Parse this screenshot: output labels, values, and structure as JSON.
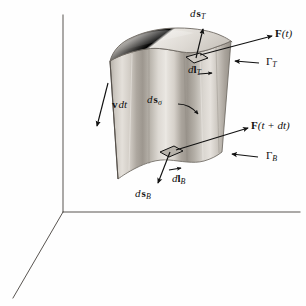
{
  "figure": {
    "name": "swept-surface-diagram",
    "background_color": "#fefefe",
    "ink_color": "#111111",
    "axis_color": "#555555",
    "surface_colors": {
      "top_cap_light": "#dedad4",
      "top_cap_mid": "#cfcac3",
      "body_light": "#e7e3dd",
      "body_mid": "#c9c4bc",
      "body_dark": "#a8a39b",
      "body_darkest": "#8f8a82",
      "outline": "#6d6862"
    }
  },
  "axes": {
    "origin_label": "",
    "vertical_axis_name": "vertical-axis",
    "horizontal_axis_name": "horizontal-axis",
    "depth_axis_name": "depth-axis"
  },
  "labels": {
    "ds_top": {
      "d": "d",
      "vec": "s",
      "sub": "T"
    },
    "F_t": {
      "vec": "F",
      "arg": "(t)"
    },
    "gamma_top": {
      "sym": "Γ",
      "sub": "T"
    },
    "dl_top": {
      "d": "d",
      "vec": "l",
      "sub": "T"
    },
    "v_dt": {
      "vec": "v",
      "rest": "dt"
    },
    "ds_sigma": {
      "d": "d",
      "vec": "s",
      "sub": "σ"
    },
    "F_t_dt": {
      "vec": "F",
      "arg": "(t + dt)"
    },
    "gamma_bottom": {
      "sym": "Γ",
      "sub": "B"
    },
    "dl_bottom": {
      "d": "d",
      "vec": "l",
      "sub": "B"
    },
    "ds_bottom": {
      "d": "d",
      "vec": "s",
      "sub": "B"
    }
  },
  "elements": {
    "top_cap": "top-cap-surface",
    "lateral_surface": "lateral-swept-surface",
    "top_patch": "top-differential-patch",
    "bottom_patch": "bottom-differential-patch",
    "arrow_ds_top": "ds-top-arrow",
    "arrow_ds_bottom": "ds-bottom-arrow",
    "arrow_F_t": "force-t-arrow",
    "arrow_F_t_dt": "force-t-plus-dt-arrow",
    "arrow_gamma_top": "gamma-top-pointer-arrow",
    "arrow_gamma_bottom": "gamma-bottom-pointer-arrow",
    "arrow_v_dt": "velocity-dt-arrow",
    "arrow_ds_sigma": "ds-sigma-curved-arrow",
    "arrow_dl_top": "dl-top-arrow",
    "arrow_dl_bottom": "dl-bottom-arrow"
  }
}
